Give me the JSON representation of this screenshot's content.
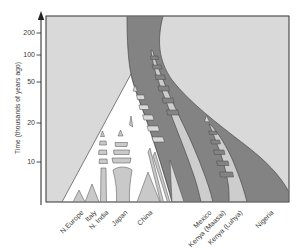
{
  "figure": {
    "y_axis": {
      "label": "Time (thousands of years ago)",
      "ticks": [
        "200",
        "100",
        "50",
        "20",
        "10"
      ]
    },
    "x_axis": {
      "categories": [
        "N.Europe",
        "Italy",
        "N. India",
        "Japan",
        "China",
        "Mexico",
        "Kenya (Maasai)",
        "Kenya (Luhya)",
        "Nigeria"
      ]
    },
    "colors": {
      "page_bg": "#ffffff",
      "plot_bg": "#d9d9d9",
      "dark_band": "#838383",
      "light_band": "#cdcdcd",
      "fan_white": "#ffffff",
      "leaf_gray": "#c9c9c9",
      "outline": "#4a4a4a",
      "axis": "#3a3a3a"
    }
  },
  "chart_data": {
    "type": "area",
    "title": "",
    "xlabel": "",
    "ylabel": "Time (thousands of years ago)",
    "categories": [
      "N.Europe",
      "Italy",
      "N. India",
      "Japan",
      "China",
      "Mexico",
      "Kenya (Maasai)",
      "Kenya (Luhya)",
      "Nigeria"
    ],
    "y_ticks": [
      200,
      100,
      50,
      20,
      10
    ],
    "y_units": "thousands of years ago",
    "y_scale": "log-like, oldest at top",
    "series": [
      {
        "name": "African ancestral lineage (dark shading)",
        "members": [
          "Kenya (Maasai)",
          "Nigeria"
        ],
        "root_time_kya": 200,
        "note": "continuous dark trunk from top of plot to African leaves"
      },
      {
        "name": "Out-of-Africa fan (white)",
        "members": [
          "N.Europe",
          "Italy",
          "N. India",
          "Japan",
          "China"
        ],
        "divergence_time_kya": 60
      },
      {
        "name": "Mexico lineage (light band)",
        "members": [
          "Mexico"
        ],
        "divergence_time_kya": 120,
        "gene_flow_stripes_kya": [
          120,
          25
        ]
      },
      {
        "name": "Kenya (Luhya) lineage (light band)",
        "members": [
          "Kenya (Luhya)"
        ],
        "divergence_time_kya": 20,
        "gene_flow_stripes_kya": [
          25,
          8
        ]
      },
      {
        "name": "Within-fan leaf ladders",
        "members": [
          "N. India",
          "Japan"
        ],
        "gene_flow_stripes_kya": [
          18,
          9
        ]
      }
    ],
    "annotations": [
      "Hatched ladder segments between diverging bands depict episodes of gene flow",
      "Small triangles mark leaf tips and ladder arrowheads"
    ],
    "legend": "none",
    "grid": "off"
  }
}
